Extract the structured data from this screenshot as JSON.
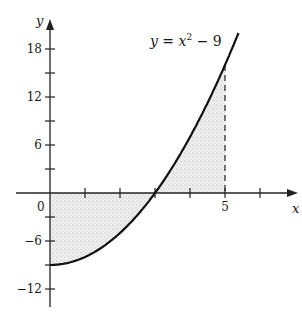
{
  "diagram": {
    "function_label": {
      "y": "y",
      "eq": " = ",
      "x": "x",
      "exp": "2",
      "rest": " − 9"
    },
    "axes": {
      "x_label": "x",
      "y_label": "y",
      "origin_label": "0",
      "x_ticks": [
        1,
        2,
        3,
        4,
        5,
        6
      ],
      "x_tick_labels": [
        {
          "value": 5,
          "label": "5"
        }
      ],
      "y_ticks": [
        18,
        15,
        12,
        9,
        6,
        3,
        -3,
        -6,
        -9,
        -12
      ],
      "y_tick_labels": [
        {
          "value": 18,
          "label": "18"
        },
        {
          "value": 12,
          "label": "12"
        },
        {
          "value": 6,
          "label": "6"
        },
        {
          "value": -6,
          "label": "−6"
        },
        {
          "value": -12,
          "label": "−12"
        }
      ]
    },
    "function": "x^2 - 9",
    "shaded_region": {
      "from_x": 0,
      "to_x": 5,
      "between": "curve and x-axis"
    },
    "dashed_line_at_x": 5,
    "colors": {
      "curve": "#111111",
      "axes": "#222222",
      "shade": "#e6e6e6"
    }
  },
  "chart_data": {
    "type": "line",
    "xlabel": "x",
    "ylabel": "y",
    "x": [
      0,
      0.5,
      1,
      1.5,
      2,
      2.5,
      3,
      3.5,
      4,
      4.5,
      5,
      5.39
    ],
    "series": [
      {
        "name": "y = x^2 - 9",
        "values": [
          -9,
          -8.75,
          -8,
          -6.75,
          -5,
          -2.75,
          0,
          3.25,
          7,
          11.25,
          16,
          20
        ]
      }
    ],
    "xlim": [
      -1,
      7
    ],
    "ylim": [
      -15,
      21
    ],
    "x_ticks": [
      1,
      2,
      3,
      4,
      5,
      6
    ],
    "y_ticks": [
      -12,
      -9,
      -6,
      -3,
      3,
      6,
      9,
      12,
      15,
      18
    ],
    "annotations": [
      "shaded area between curve and x-axis for 0 ≤ x ≤ 5",
      "dashed vertical line at x = 5"
    ],
    "grid": false
  }
}
